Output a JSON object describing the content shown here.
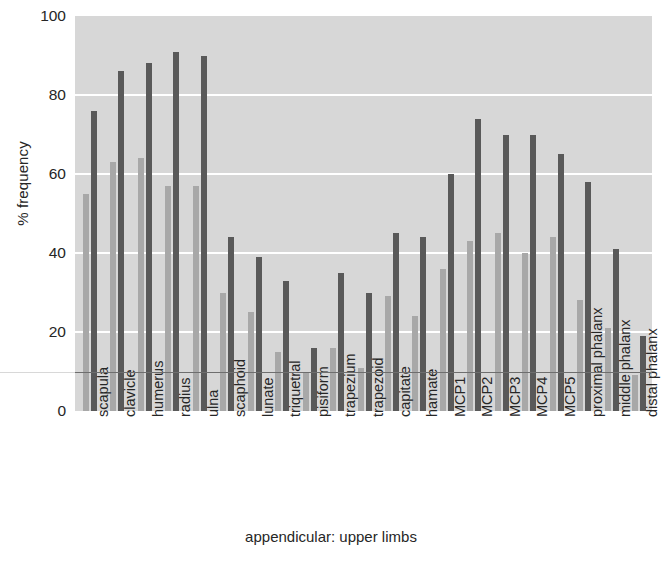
{
  "chart_data": {
    "type": "bar",
    "title": "",
    "xlabel": "appendicular: upper limbs",
    "ylabel": "% frequency",
    "ylim": [
      0,
      100
    ],
    "yticks": [
      0,
      20,
      40,
      60,
      80,
      100
    ],
    "grid": true,
    "legend": "none",
    "reference_line": 10,
    "categories": [
      "scapula",
      "clavicle",
      "humerus",
      "radius",
      "ulna",
      "scaphoid",
      "lunate",
      "triquetral",
      "pisiform",
      "trapezium",
      "trapezoid",
      "capitate",
      "hamate",
      "MCP1",
      "MCP2",
      "MCP3",
      "MCP4",
      "MCP5",
      "proximal phalanx",
      "middle phalanx",
      "distal phalanx"
    ],
    "series": [
      {
        "name": "light",
        "color": "#a8a8a8",
        "values": [
          55,
          63,
          64,
          57,
          57,
          30,
          25,
          15,
          10,
          16,
          11,
          29,
          24,
          36,
          43,
          45,
          40,
          44,
          28,
          21,
          9
        ]
      },
      {
        "name": "dark",
        "color": "#595959",
        "values": [
          76,
          86,
          88,
          91,
          90,
          44,
          39,
          33,
          16,
          35,
          30,
          45,
          44,
          60,
          74,
          70,
          70,
          65,
          58,
          41,
          19
        ]
      }
    ]
  },
  "axes": {
    "y_title": "% frequency",
    "x_title": "appendicular: upper limbs",
    "y_tick_labels": [
      "100",
      "80",
      "60",
      "40",
      "20",
      "0"
    ]
  },
  "colors": {
    "plot_background": "#d7d7d7",
    "gridline": "#ffffff",
    "bar_light": "#a8a8a8",
    "bar_dark": "#595959",
    "reference_line": "#6e6e6e",
    "text": "#262626"
  }
}
